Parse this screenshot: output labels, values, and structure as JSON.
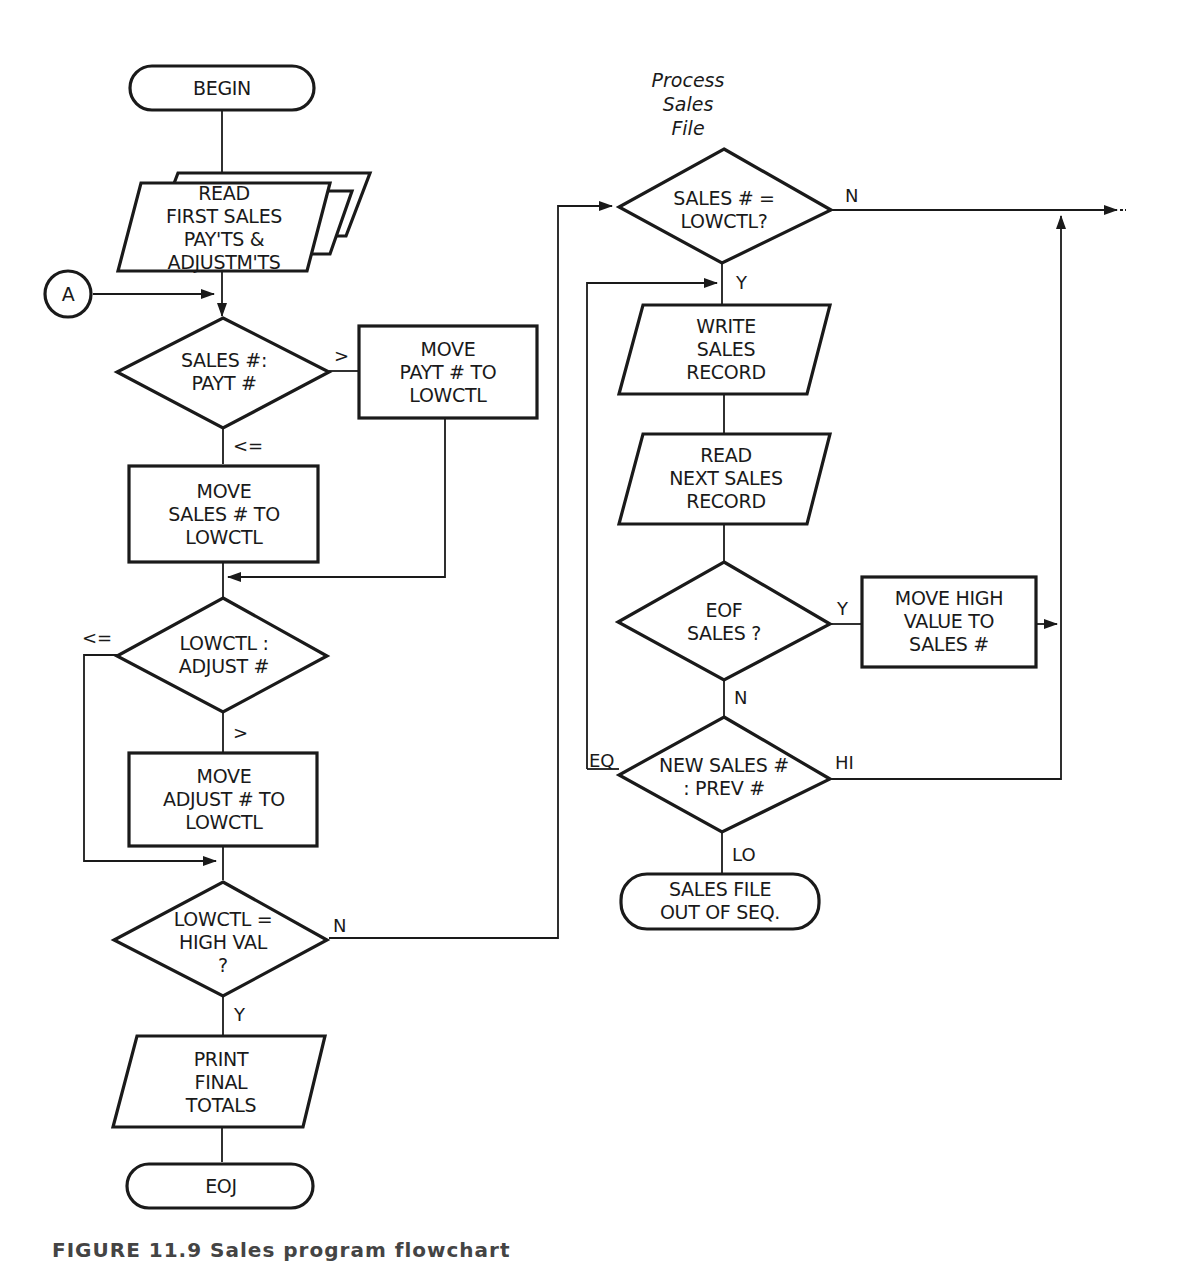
{
  "diagram": {
    "type": "flowchart",
    "note": "Process\nSales\nFile",
    "nodes": {
      "begin": "BEGIN",
      "read_first": "READ\nFIRST SALES\nPAY'TS &\nADJUSTM'TS",
      "connector_a": "A",
      "dec_sales_payt": "SALES #:\nPAYT #",
      "move_payt": "MOVE\nPAYT # TO\nLOWCTL",
      "move_sales": "MOVE\nSALES # TO\nLOWCTL",
      "dec_lowctl_adjust": "LOWCTL :\nADJUST #",
      "move_adjust": "MOVE\nADJUST # TO\nLOWCTL",
      "dec_highval": "LOWCTL =\nHIGH VAL\n?",
      "print_totals": "PRINT\nFINAL\nTOTALS",
      "eoj": "EOJ",
      "dec_sales_lowctl": "SALES # =\nLOWCTL?",
      "write_sales": "WRITE\nSALES\nRECORD",
      "read_next": "READ\nNEXT SALES\nRECORD",
      "dec_eof": "EOF\nSALES ?",
      "move_high": "MOVE HIGH\nVALUE TO\nSALES #",
      "dec_new_prev": "NEW SALES #\n: PREV #",
      "out_of_seq": "SALES FILE\nOUT OF SEQ."
    },
    "edge_labels": {
      "gt1": ">",
      "le1": "<=",
      "le2": "<=",
      "gt2": ">",
      "n_highval": "N",
      "y_highval": "Y",
      "n_sales_lowctl": "N",
      "y_sales_lowctl": "Y",
      "y_eof": "Y",
      "n_eof": "N",
      "eq": "EQ",
      "hi": "HI",
      "lo": "LO",
      "continue": "--"
    },
    "caption": "FIGURE 11.9   Sales program flowchart"
  }
}
